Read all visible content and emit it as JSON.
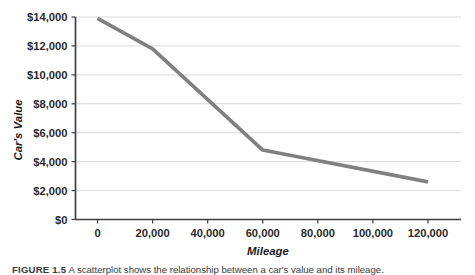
{
  "figure": {
    "caption_label": "FIGURE 1.5",
    "caption_text": "A scatterplot shows the relationship between a car's value and its mileage."
  },
  "chart_data": {
    "type": "line",
    "title": "",
    "xlabel": "Mileage",
    "ylabel": "Car's Value",
    "x": [
      0,
      20000,
      60000,
      120000
    ],
    "values": [
      13900,
      11800,
      4800,
      2600
    ],
    "series": [
      {
        "name": "Car's Value",
        "values": [
          13900,
          11800,
          4800,
          2600
        ],
        "color": "#808080"
      }
    ],
    "xlim": [
      -8000,
      132000
    ],
    "ylim": [
      0,
      14000
    ],
    "xticks": [
      0,
      20000,
      40000,
      60000,
      80000,
      100000,
      120000
    ],
    "xtick_labels": [
      "0",
      "20,000",
      "40,000",
      "60,000",
      "80,000",
      "100,000",
      "120,000"
    ],
    "yticks": [
      0,
      2000,
      4000,
      6000,
      8000,
      10000,
      12000,
      14000
    ],
    "ytick_labels": [
      "$0",
      "$2,000",
      "$4,000",
      "$6,000",
      "$8,000",
      "$10,000",
      "$12,000",
      "$14,000"
    ],
    "grid": "horizontal",
    "legend": "none",
    "line_color": "#808080",
    "axis_color": "#3f3f3f",
    "grid_color": "#d9d9d9"
  }
}
